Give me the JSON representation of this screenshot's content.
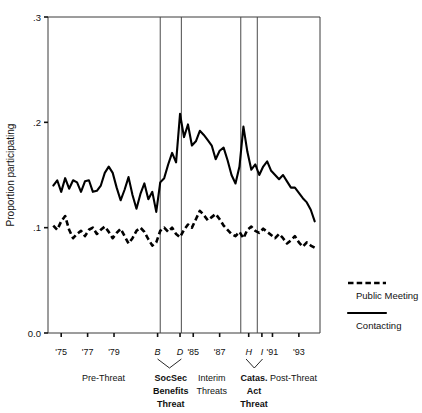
{
  "chart_data": {
    "type": "line",
    "title": "",
    "subtitle": "",
    "xlabel": "",
    "ylabel": "Proportion participating",
    "ylim": [
      0.0,
      0.3
    ],
    "xlim": [
      1974.0,
      1994.6
    ],
    "grid": false,
    "legend_position": "right",
    "y_ticks": [
      "0.0",
      ".1",
      ".2",
      ".3"
    ],
    "y_tick_values": [
      0.0,
      0.1,
      0.2,
      0.3
    ],
    "x_tick_labels": [
      "'75",
      "'77",
      "'79",
      "B",
      "D",
      "'85",
      "'87",
      "H",
      "I",
      "'91",
      "'93"
    ],
    "x_tick_values": [
      1975,
      1977,
      1979,
      1982.3,
      1984.0,
      1985,
      1987,
      1989.2,
      1990.2,
      1991,
      1993
    ],
    "x_tick_italic": [
      false,
      false,
      false,
      true,
      true,
      false,
      false,
      true,
      true,
      false,
      false
    ],
    "period_dividers": [
      1982.5,
      1984.1,
      1988.6,
      1989.85
    ],
    "periods": [
      {
        "label": "Pre-Threat",
        "bold": false,
        "center": 1978.2,
        "brace": false
      },
      {
        "label": "SocSec\nBenefits\nThreat",
        "bold": true,
        "center": 1983.3,
        "brace": true,
        "brace_from": 1982.3,
        "brace_to": 1984.1
      },
      {
        "label": "Interim\nThreats",
        "bold": false,
        "center": 1986.4,
        "brace": false
      },
      {
        "label": "Catas.\nAct\nThreat",
        "bold": true,
        "center": 1989.6,
        "brace": true,
        "brace_from": 1989.0,
        "brace_to": 1990.25
      },
      {
        "label": "Post-Threat",
        "bold": false,
        "center": 1992.6,
        "brace": false
      }
    ],
    "series": [
      {
        "name": "Contacting",
        "style": "solid",
        "x": [
          1974.4,
          1974.7,
          1975.0,
          1975.3,
          1975.6,
          1975.9,
          1976.2,
          1976.5,
          1976.8,
          1977.1,
          1977.4,
          1977.7,
          1978.0,
          1978.3,
          1978.6,
          1978.9,
          1979.2,
          1979.5,
          1979.8,
          1980.1,
          1980.4,
          1980.7,
          1981.0,
          1981.3,
          1981.6,
          1981.9,
          1982.2,
          1982.5,
          1982.8,
          1983.1,
          1983.4,
          1983.7,
          1984.0,
          1984.3,
          1984.6,
          1984.9,
          1985.2,
          1985.5,
          1985.8,
          1986.1,
          1986.4,
          1986.7,
          1987.0,
          1987.3,
          1987.6,
          1987.9,
          1988.2,
          1988.5,
          1988.8,
          1989.1,
          1989.4,
          1989.7,
          1990.0,
          1990.3,
          1990.6,
          1990.9,
          1991.2,
          1991.5,
          1991.8,
          1992.1,
          1992.4,
          1992.7,
          1993.0,
          1993.3,
          1993.6,
          1993.9,
          1994.2
        ],
        "y": [
          0.14,
          0.145,
          0.134,
          0.147,
          0.137,
          0.145,
          0.143,
          0.134,
          0.144,
          0.145,
          0.134,
          0.135,
          0.14,
          0.152,
          0.158,
          0.152,
          0.138,
          0.126,
          0.136,
          0.148,
          0.131,
          0.118,
          0.132,
          0.142,
          0.127,
          0.134,
          0.115,
          0.143,
          0.147,
          0.16,
          0.171,
          0.162,
          0.208,
          0.186,
          0.198,
          0.178,
          0.182,
          0.192,
          0.188,
          0.183,
          0.178,
          0.165,
          0.173,
          0.176,
          0.164,
          0.15,
          0.142,
          0.158,
          0.196,
          0.172,
          0.155,
          0.16,
          0.15,
          0.158,
          0.163,
          0.154,
          0.15,
          0.146,
          0.15,
          0.144,
          0.138,
          0.138,
          0.133,
          0.128,
          0.124,
          0.117,
          0.106
        ]
      },
      {
        "name": "Public Meeting",
        "style": "dashed",
        "x": [
          1974.4,
          1974.7,
          1975.0,
          1975.3,
          1975.6,
          1975.9,
          1976.2,
          1976.5,
          1976.8,
          1977.1,
          1977.4,
          1977.7,
          1978.0,
          1978.3,
          1978.6,
          1978.9,
          1979.2,
          1979.5,
          1979.8,
          1980.1,
          1980.4,
          1980.7,
          1981.0,
          1981.3,
          1981.6,
          1981.9,
          1982.2,
          1982.5,
          1982.8,
          1983.1,
          1983.4,
          1983.7,
          1984.0,
          1984.3,
          1984.6,
          1984.9,
          1985.2,
          1985.5,
          1985.8,
          1986.1,
          1986.4,
          1986.7,
          1987.0,
          1987.3,
          1987.6,
          1987.9,
          1988.2,
          1988.5,
          1988.8,
          1989.1,
          1989.4,
          1989.7,
          1990.0,
          1990.3,
          1990.6,
          1990.9,
          1991.2,
          1991.5,
          1991.8,
          1992.1,
          1992.4,
          1992.7,
          1993.0,
          1993.3,
          1993.6,
          1993.9,
          1994.2
        ],
        "y": [
          0.102,
          0.098,
          0.106,
          0.111,
          0.098,
          0.09,
          0.094,
          0.097,
          0.092,
          0.098,
          0.1,
          0.094,
          0.098,
          0.101,
          0.096,
          0.09,
          0.095,
          0.099,
          0.092,
          0.085,
          0.09,
          0.097,
          0.1,
          0.096,
          0.089,
          0.083,
          0.086,
          0.097,
          0.1,
          0.096,
          0.1,
          0.094,
          0.091,
          0.098,
          0.103,
          0.1,
          0.108,
          0.116,
          0.112,
          0.107,
          0.11,
          0.113,
          0.108,
          0.102,
          0.098,
          0.094,
          0.092,
          0.096,
          0.09,
          0.098,
          0.101,
          0.097,
          0.095,
          0.099,
          0.096,
          0.093,
          0.09,
          0.094,
          0.09,
          0.085,
          0.088,
          0.092,
          0.086,
          0.082,
          0.086,
          0.083,
          0.081
        ]
      }
    ],
    "legend": [
      {
        "label": "Public Meeting",
        "style": "dashed"
      },
      {
        "label": "Contacting",
        "style": "solid"
      }
    ]
  }
}
